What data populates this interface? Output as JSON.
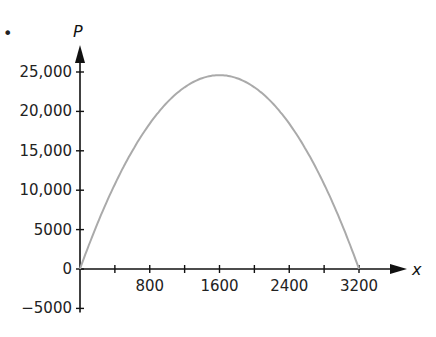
{
  "chart_data": {
    "type": "line",
    "title": "",
    "xlabel": "x",
    "ylabel": "P",
    "xlim": [
      0,
      3600
    ],
    "ylim": [
      -5000,
      27500
    ],
    "x_ticks": [
      400,
      800,
      1200,
      1600,
      2000,
      2400,
      2800,
      3200
    ],
    "x_tick_labels": [
      "",
      "800",
      "",
      "1600",
      "",
      "2400",
      "",
      "3200"
    ],
    "y_ticks": [
      -5000,
      0,
      5000,
      10000,
      15000,
      20000,
      25000
    ],
    "y_tick_labels": [
      "−5000",
      "0",
      "5000",
      "10,000",
      "15,000",
      "20,000",
      "25,000"
    ],
    "grid": false,
    "series": [
      {
        "name": "P(x)",
        "shape": "downward parabola",
        "x": [
          0,
          400,
          800,
          1200,
          1600,
          2000,
          2400,
          2800,
          3200
        ],
        "values": [
          0,
          10750,
          18400,
          23000,
          24600,
          23000,
          18400,
          10750,
          0
        ],
        "color": "#aaaaaa"
      }
    ],
    "annotations": {
      "bullet": "•"
    }
  }
}
